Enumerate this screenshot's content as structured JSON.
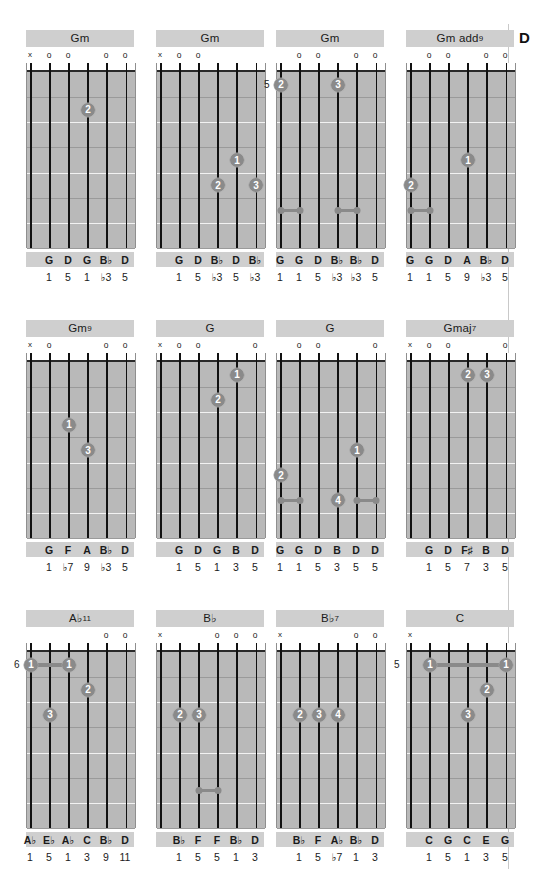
{
  "page": {
    "section_tab": "D",
    "width": 543,
    "height": 893,
    "colors": {
      "fretboard": "#b9b9b9",
      "title_bar": "#cfcfcf",
      "dot": "#8a8a8a",
      "string": "#111111",
      "nut": "#ffffff"
    }
  },
  "chords": [
    {
      "name": "Gm",
      "name_parts": {
        "root": "Gm",
        "sup": ""
      },
      "fret_label": "",
      "markers": [
        "x",
        "o",
        "o",
        "",
        "o",
        "o"
      ],
      "notes": [
        "",
        "G",
        "D",
        "G",
        "B♭",
        "D"
      ],
      "degrees": [
        "",
        "1",
        "5",
        "1",
        "♭3",
        "5"
      ],
      "dots": [
        {
          "string": 4,
          "fret": 2,
          "finger": "2"
        }
      ],
      "barres": [],
      "wide_barres": []
    },
    {
      "name": "Gm",
      "name_parts": {
        "root": "Gm",
        "sup": ""
      },
      "fret_label": "",
      "markers": [
        "x",
        "o",
        "o",
        "",
        "",
        ""
      ],
      "notes": [
        "",
        "G",
        "D",
        "B♭",
        "D",
        "B♭"
      ],
      "degrees": [
        "",
        "1",
        "5",
        "♭3",
        "5",
        "♭3"
      ],
      "dots": [
        {
          "string": 5,
          "fret": 4,
          "finger": "1"
        },
        {
          "string": 4,
          "fret": 5,
          "finger": "2"
        },
        {
          "string": 6,
          "fret": 5,
          "finger": "3"
        }
      ],
      "barres": [],
      "wide_barres": []
    },
    {
      "name": "Gm",
      "name_parts": {
        "root": "Gm",
        "sup": ""
      },
      "fret_label": "5",
      "markers": [
        "",
        "o",
        "o",
        "",
        "o",
        "o"
      ],
      "notes": [
        "G",
        "G",
        "D",
        "B♭",
        "B♭",
        "D"
      ],
      "degrees": [
        "1",
        "1",
        "5",
        "♭3",
        "♭3",
        "5"
      ],
      "dots": [
        {
          "string": 1,
          "fret": 1,
          "finger": "2"
        },
        {
          "string": 4,
          "fret": 1,
          "finger": "3"
        }
      ],
      "barres": [
        {
          "from": 1,
          "to": 2,
          "fret": 6
        },
        {
          "from": 4,
          "to": 5,
          "fret": 6
        }
      ],
      "wide_barres": []
    },
    {
      "name": "Gm add9",
      "name_parts": {
        "root": "Gm add",
        "sup": "9"
      },
      "fret_label": "",
      "markers": [
        "",
        "o",
        "o",
        "",
        "o",
        "o"
      ],
      "notes": [
        "G",
        "G",
        "D",
        "A",
        "B♭",
        "D"
      ],
      "degrees": [
        "1",
        "1",
        "5",
        "9",
        "♭3",
        "5"
      ],
      "dots": [
        {
          "string": 4,
          "fret": 4,
          "finger": "1"
        },
        {
          "string": 1,
          "fret": 5,
          "finger": "2"
        }
      ],
      "barres": [
        {
          "from": 1,
          "to": 2,
          "fret": 6
        }
      ],
      "wide_barres": []
    },
    {
      "name": "Gm9",
      "name_parts": {
        "root": "Gm",
        "sup": "9"
      },
      "fret_label": "",
      "markers": [
        "x",
        "o",
        "",
        "",
        "o",
        "o"
      ],
      "notes": [
        "",
        "G",
        "F",
        "A",
        "B♭",
        "D"
      ],
      "degrees": [
        "",
        "1",
        "♭7",
        "9",
        "♭3",
        "5"
      ],
      "dots": [
        {
          "string": 3,
          "fret": 3,
          "finger": "1"
        },
        {
          "string": 4,
          "fret": 4,
          "finger": "3"
        }
      ],
      "barres": [],
      "wide_barres": []
    },
    {
      "name": "G",
      "name_parts": {
        "root": "G",
        "sup": ""
      },
      "fret_label": "",
      "markers": [
        "x",
        "o",
        "o",
        "",
        "",
        "o"
      ],
      "notes": [
        "",
        "G",
        "D",
        "G",
        "B",
        "D"
      ],
      "degrees": [
        "",
        "1",
        "5",
        "1",
        "3",
        "5"
      ],
      "dots": [
        {
          "string": 5,
          "fret": 1,
          "finger": "1"
        },
        {
          "string": 4,
          "fret": 2,
          "finger": "2"
        }
      ],
      "barres": [],
      "wide_barres": []
    },
    {
      "name": "G",
      "name_parts": {
        "root": "G",
        "sup": ""
      },
      "fret_label": "",
      "markers": [
        "",
        "o",
        "o",
        "",
        "",
        "o"
      ],
      "notes": [
        "G",
        "G",
        "D",
        "B",
        "D",
        "D"
      ],
      "degrees": [
        "1",
        "1",
        "5",
        "3",
        "5",
        "5"
      ],
      "dots": [
        {
          "string": 5,
          "fret": 4,
          "finger": "1"
        },
        {
          "string": 1,
          "fret": 5,
          "finger": "2"
        },
        {
          "string": 4,
          "fret": 6,
          "finger": "4"
        }
      ],
      "barres": [
        {
          "from": 1,
          "to": 2,
          "fret": 6
        },
        {
          "from": 5,
          "to": 6,
          "fret": 6
        }
      ],
      "wide_barres": []
    },
    {
      "name": "Gmaj7",
      "name_parts": {
        "root": "Gmaj",
        "sup": "7"
      },
      "fret_label": "",
      "markers": [
        "x",
        "o",
        "o",
        "",
        "",
        "o"
      ],
      "notes": [
        "",
        "G",
        "D",
        "F♯",
        "B",
        "D"
      ],
      "degrees": [
        "",
        "1",
        "5",
        "7",
        "3",
        "5"
      ],
      "dots": [
        {
          "string": 4,
          "fret": 1,
          "finger": "2"
        },
        {
          "string": 5,
          "fret": 1,
          "finger": "3"
        }
      ],
      "barres": [],
      "wide_barres": []
    },
    {
      "name": "A♭11",
      "name_parts": {
        "root": "A♭",
        "sup": "11"
      },
      "fret_label": "6",
      "markers": [
        "",
        "",
        "",
        "",
        "o",
        "o"
      ],
      "notes": [
        "A♭",
        "E♭",
        "A♭",
        "C",
        "B♭",
        "D"
      ],
      "degrees": [
        "1",
        "5",
        "1",
        "3",
        "9",
        "11"
      ],
      "dots": [
        {
          "string": 1,
          "fret": 1,
          "finger": "1"
        },
        {
          "string": 3,
          "fret": 1,
          "finger": "1"
        },
        {
          "string": 4,
          "fret": 2,
          "finger": "2"
        },
        {
          "string": 2,
          "fret": 3,
          "finger": "3"
        }
      ],
      "barres": [],
      "wide_barres": [
        {
          "from": 1,
          "to": 3,
          "fret": 1
        }
      ]
    },
    {
      "name": "B♭",
      "name_parts": {
        "root": "B♭",
        "sup": ""
      },
      "fret_label": "",
      "markers": [
        "x",
        "",
        "",
        "o",
        "o",
        "o"
      ],
      "notes": [
        "",
        "B♭",
        "F",
        "F",
        "B♭",
        "D"
      ],
      "degrees": [
        "",
        "1",
        "5",
        "5",
        "1",
        "3"
      ],
      "dots": [
        {
          "string": 2,
          "fret": 3,
          "finger": "2"
        },
        {
          "string": 3,
          "fret": 3,
          "finger": "3"
        }
      ],
      "barres": [
        {
          "from": 3,
          "to": 4,
          "fret": 6
        }
      ],
      "wide_barres": []
    },
    {
      "name": "B♭7",
      "name_parts": {
        "root": "B♭",
        "sup": "7"
      },
      "fret_label": "",
      "markers": [
        "x",
        "",
        "",
        "",
        "o",
        "o"
      ],
      "notes": [
        "",
        "B♭",
        "F",
        "A♭",
        "B♭",
        "D"
      ],
      "degrees": [
        "",
        "1",
        "5",
        "♭7",
        "1",
        "3"
      ],
      "dots": [
        {
          "string": 2,
          "fret": 3,
          "finger": "2"
        },
        {
          "string": 3,
          "fret": 3,
          "finger": "3"
        },
        {
          "string": 4,
          "fret": 3,
          "finger": "4"
        }
      ],
      "barres": [],
      "wide_barres": []
    },
    {
      "name": "C",
      "name_parts": {
        "root": "C",
        "sup": ""
      },
      "fret_label": "5",
      "markers": [
        "x",
        "",
        "",
        "",
        "",
        ""
      ],
      "notes": [
        "",
        "C",
        "G",
        "C",
        "E",
        "G"
      ],
      "degrees": [
        "",
        "1",
        "5",
        "1",
        "3",
        "5"
      ],
      "dots": [
        {
          "string": 2,
          "fret": 1,
          "finger": "1"
        },
        {
          "string": 6,
          "fret": 1,
          "finger": "1"
        },
        {
          "string": 5,
          "fret": 2,
          "finger": "2"
        },
        {
          "string": 4,
          "fret": 3,
          "finger": "3"
        }
      ],
      "barres": [],
      "wide_barres": [
        {
          "from": 2,
          "to": 6,
          "fret": 1
        }
      ]
    }
  ]
}
